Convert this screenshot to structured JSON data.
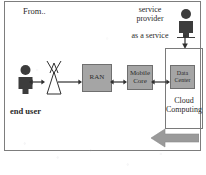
{
  "diagram": {
    "title_note": "From..",
    "labels": {
      "from": "From..",
      "service_provider": "service\nprovider",
      "service_provider_line1": "service",
      "service_provider_line2": "provider",
      "as_a_service": "as a service",
      "end_user": "end user",
      "cloud_computing_line1": "Cloud",
      "cloud_computing_line2": "Computing"
    },
    "nodes": [
      {
        "id": "end-user",
        "type": "person-icon",
        "label": "end user"
      },
      {
        "id": "antenna",
        "type": "antenna-tower-icon",
        "label": ""
      },
      {
        "id": "ran",
        "type": "box",
        "label": "RAN"
      },
      {
        "id": "mobile-core",
        "type": "box",
        "label_line1": "Mobile",
        "label_line2": "Core"
      },
      {
        "id": "data-center",
        "type": "box",
        "label_line1": "Data",
        "label_line2": "Center"
      },
      {
        "id": "service-provider",
        "type": "person-icon",
        "label": "service provider"
      },
      {
        "id": "cloud-computing",
        "type": "container",
        "label": "Cloud Computing"
      }
    ],
    "connectors": [
      {
        "from": "end-user",
        "to": "antenna",
        "style": "double-arrow"
      },
      {
        "from": "antenna",
        "to": "ran",
        "style": "arrow-right"
      },
      {
        "from": "ran",
        "to": "mobile-core",
        "style": "double-arrow"
      },
      {
        "from": "mobile-core",
        "to": "data-center",
        "style": "double-arrow"
      },
      {
        "from": "service-provider",
        "to": "cloud-computing",
        "style": "arrow-down"
      }
    ],
    "annotations": [
      {
        "id": "bottom-arrow",
        "type": "block-arrow",
        "direction": "left"
      }
    ],
    "colors": {
      "box_fill": "#a5a5a5",
      "box_stroke": "#6f6f6f",
      "frame_stroke": "#7d7d7d",
      "icon_fill": "#3c3c3c",
      "big_arrow_fill": "#9a9a9a",
      "text": "#2a2a2a",
      "background": "#ffffff"
    }
  }
}
